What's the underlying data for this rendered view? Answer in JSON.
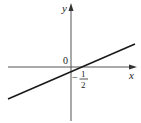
{
  "figure": {
    "type": "coordinate-plane-linear-graph",
    "axes": {
      "x_label": "x",
      "y_label": "y",
      "origin_label": "0"
    },
    "annotations": {
      "minus_sign": "−",
      "numerator": "1",
      "denominator": "2"
    },
    "line": {
      "description": "straight line with positive slope crossing the x-axis at x = 1/2 region and the y-axis slightly below the origin",
      "color": "#1a1a1a"
    },
    "colors": {
      "axis": "#555555",
      "line": "#1a1a1a",
      "text": "#222222",
      "background": "#ffffff"
    }
  }
}
